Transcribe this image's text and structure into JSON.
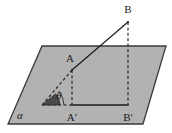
{
  "figure": {
    "kind": "solid-geometry-line-plane-angle-diagram",
    "background_color": "#ffffff",
    "plane": {
      "name": "alpha",
      "label": "α",
      "fill_color": "#b2b2b2",
      "stroke_color": "#3a3a3a",
      "label_position": {
        "x": 20,
        "y": 119
      },
      "corners": [
        {
          "x": 42,
          "y": 46
        },
        {
          "x": 166,
          "y": 46
        },
        {
          "x": 143,
          "y": 124
        },
        {
          "x": 8,
          "y": 124
        }
      ]
    },
    "points": [
      {
        "id": "B",
        "label": "B",
        "x": 128,
        "y": 22,
        "label_x": 128,
        "label_y": 13,
        "italic": false
      },
      {
        "id": "A",
        "label": "A",
        "x": 72,
        "y": 70,
        "label_x": 70,
        "label_y": 62,
        "italic": false
      },
      {
        "id": "Ap",
        "label": "A′",
        "x": 72,
        "y": 105,
        "label_x": 72,
        "label_y": 121,
        "italic": false
      },
      {
        "id": "Bp",
        "label": "B′",
        "x": 128,
        "y": 105,
        "label_x": 128,
        "label_y": 121,
        "italic": false
      },
      {
        "id": "V",
        "label": "",
        "x": 42,
        "y": 105,
        "label_x": 42,
        "label_y": 105,
        "italic": false
      }
    ],
    "angle": {
      "symbol": "θ",
      "label_x": 59,
      "label_y": 99,
      "vertex_x": 42,
      "vertex_y": 105,
      "wedge_fill": "#4a4a4a",
      "arc_stroke": "#2a2a2a"
    },
    "segments": [
      {
        "id": "seg-A-to-B",
        "from": "A",
        "to": "B",
        "style": "solid",
        "stroke": "#1b1b1b",
        "width": 1.2
      },
      {
        "id": "seg-vertex-to-A",
        "from": "V",
        "to": "A",
        "style": "dashed",
        "stroke": "#1b1b1b",
        "width": 1.1
      },
      {
        "id": "seg-A-to-Aprime",
        "from": "A",
        "to": "Ap",
        "style": "dashed",
        "stroke": "#1b1b1b",
        "width": 1.1
      },
      {
        "id": "seg-B-to-Bprime",
        "from": "B",
        "to": "Bp",
        "style": "dashed",
        "stroke": "#1b1b1b",
        "width": 1.1
      },
      {
        "id": "seg-vertex-to-Aprime",
        "from": "V",
        "to": "Ap",
        "style": "dashed",
        "stroke": "#1b1b1b",
        "width": 1.1
      },
      {
        "id": "seg-Aprime-to-Bprime",
        "from": "Ap",
        "to": "Bp",
        "style": "solid",
        "stroke": "#1b1b1b",
        "width": 1.6
      }
    ]
  }
}
